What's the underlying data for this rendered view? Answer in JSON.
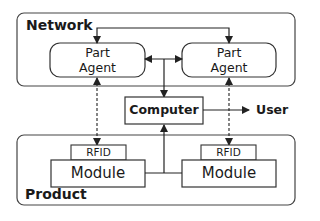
{
  "diagram": {
    "network": {
      "title": "Network"
    },
    "product": {
      "title": "Product"
    },
    "agents": [
      {
        "line1": "Part",
        "line2": "Agent"
      },
      {
        "line1": "Part",
        "line2": "Agent"
      }
    ],
    "computer": {
      "label": "Computer"
    },
    "user": {
      "label": "User"
    },
    "modules": [
      {
        "tag": "RFID",
        "label": "Module"
      },
      {
        "tag": "RFID",
        "label": "Module"
      }
    ],
    "connections": [
      {
        "from": "agent-left",
        "to": "agent-right",
        "style": "solid",
        "arrows": "both",
        "route": "top"
      },
      {
        "from": "agent-left",
        "to": "agent-right",
        "style": "solid",
        "arrows": "both",
        "route": "middle"
      },
      {
        "from": "agent-junction",
        "to": "computer",
        "style": "solid",
        "arrows": "end"
      },
      {
        "from": "computer",
        "to": "user",
        "style": "solid",
        "arrows": "end"
      },
      {
        "from": "module-junction",
        "to": "computer",
        "style": "solid",
        "arrows": "end"
      },
      {
        "from": "rfid-left",
        "to": "agent-left",
        "style": "dashed",
        "arrows": "both"
      },
      {
        "from": "rfid-right",
        "to": "agent-right",
        "style": "dashed",
        "arrows": "both"
      }
    ],
    "colors": {
      "stroke": "#333333",
      "background": "#ffffff",
      "text": "#1a1a1a"
    }
  }
}
